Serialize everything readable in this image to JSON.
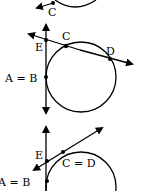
{
  "diagram": {
    "type": "geometry-tangent-secant",
    "panels": [
      {
        "id": "panel-1",
        "labels": {
          "c": "C"
        }
      },
      {
        "id": "panel-2",
        "labels": {
          "e": "E",
          "c": "C",
          "d": "D",
          "ab": "A = B"
        }
      },
      {
        "id": "panel-3",
        "labels": {
          "e": "E",
          "cd": "C = D",
          "ab": "A = B"
        }
      }
    ],
    "colors": {
      "stroke": "#000000",
      "background": "#ffffff"
    }
  }
}
